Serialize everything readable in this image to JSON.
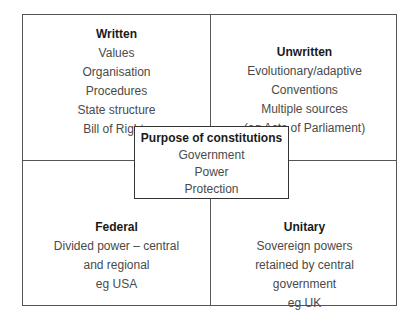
{
  "diagram": {
    "title": "Purpose of constitutions",
    "type": "quadrant-matrix-with-center",
    "colors": {
      "background": "#ffffff",
      "border": "#555555",
      "center_border": "#333333",
      "heading_text": "#1a1a1a",
      "body_text": "#4a4a4a"
    },
    "center": {
      "heading": "Purpose of constitutions",
      "lines": [
        "Government",
        "Power",
        "Protection"
      ]
    },
    "quadrants": [
      {
        "position": "top-left",
        "heading": "Written",
        "lines": [
          "Values",
          "Organisation",
          "Procedures",
          "State structure",
          "Bill of Rights"
        ]
      },
      {
        "position": "top-right",
        "heading": "Unwritten",
        "lines": [
          "Evolutionary/adaptive",
          "Conventions",
          "Multiple sources",
          "(eg Acts of Parliament)"
        ]
      },
      {
        "position": "bottom-left",
        "heading": "Federal",
        "lines": [
          "Divided power – central",
          "and regional",
          "eg USA"
        ]
      },
      {
        "position": "bottom-right",
        "heading": "Unitary",
        "lines": [
          "Sovereign powers",
          "retained by central",
          "government",
          "eg UK"
        ]
      }
    ]
  }
}
